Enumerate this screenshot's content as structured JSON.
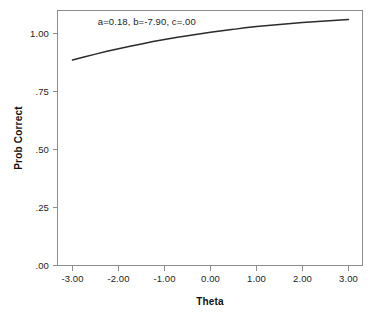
{
  "chart_data": {
    "type": "line",
    "title": "",
    "subtitle": "",
    "xlabel": "Theta",
    "ylabel": "Prob Correct",
    "xlim": [
      -3.0,
      3.0
    ],
    "ylim": [
      0.0,
      1.0
    ],
    "grid": false,
    "legend": false,
    "legend_position": "none",
    "x_ticks": [
      -3.0,
      -2.0,
      -1.0,
      0.0,
      1.0,
      2.0,
      3.0
    ],
    "x_tick_labels": [
      "-3.00",
      "-2.00",
      "-1.00",
      "0.00",
      "1.00",
      "2.00",
      "3.00"
    ],
    "y_ticks": [
      0.0,
      0.25,
      0.5,
      0.75,
      1.0
    ],
    "y_tick_labels": [
      ".00",
      ".25",
      ".50",
      ".75",
      "1.00"
    ],
    "annotations": [
      {
        "name": "irt-parameters",
        "text": "a=0.18, b=-7.90, c=.00",
        "x": -2.45,
        "y": 0.945
      }
    ],
    "parameters": {
      "a": 0.18,
      "b": -7.9,
      "c": 0.0,
      "D": 1.7,
      "model": "2PL"
    },
    "series": [
      {
        "name": "item-characteristic-curve",
        "color": "#2b2b2b",
        "x": [
          -3.0,
          -2.75,
          -2.5,
          -2.25,
          -2.0,
          -1.75,
          -1.5,
          -1.25,
          -1.0,
          -0.75,
          -0.5,
          -0.25,
          0.0,
          0.25,
          0.5,
          0.75,
          1.0,
          1.25,
          1.5,
          1.75,
          2.0,
          2.25,
          2.5,
          2.75,
          3.0
        ],
        "y": [
          0.806,
          0.818,
          0.829,
          0.84,
          0.85,
          0.86,
          0.869,
          0.878,
          0.886,
          0.894,
          0.901,
          0.908,
          0.915,
          0.921,
          0.926,
          0.932,
          0.937,
          0.941,
          0.945,
          0.949,
          0.953,
          0.956,
          0.959,
          0.962,
          0.965
        ]
      }
    ]
  },
  "axes": {
    "x_title": "Theta",
    "y_title": "Prob Correct"
  }
}
